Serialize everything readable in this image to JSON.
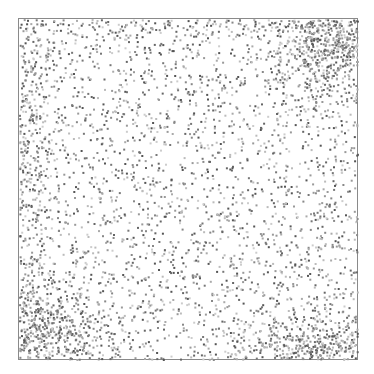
{
  "caption": {
    "text": ""
  },
  "frame": {
    "x": 18,
    "y": 18,
    "width": 340,
    "height": 342,
    "border_color": "#8a8a8a"
  },
  "dots": {
    "seed": 1337,
    "base_count": 2600,
    "dot_size": 2,
    "colors": [
      "#555555",
      "#666666",
      "#777777",
      "#888888",
      "#999999",
      "#aaaaaa",
      "#bbbbbb",
      "#cccccc"
    ],
    "clusters": [
      {
        "name": "left-edge",
        "cx": 0.02,
        "cy": 0.35,
        "sx": 0.05,
        "sy": 0.3,
        "count": 500
      },
      {
        "name": "top-right",
        "cx": 0.92,
        "cy": 0.06,
        "sx": 0.1,
        "sy": 0.1,
        "count": 800
      },
      {
        "name": "bottom-left",
        "cx": 0.05,
        "cy": 0.92,
        "sx": 0.12,
        "sy": 0.08,
        "count": 700
      },
      {
        "name": "bottom-right",
        "cx": 0.9,
        "cy": 0.96,
        "sx": 0.12,
        "sy": 0.05,
        "count": 500
      },
      {
        "name": "top-edge",
        "cx": 0.5,
        "cy": 0.01,
        "sx": 0.35,
        "sy": 0.02,
        "count": 150
      }
    ]
  }
}
